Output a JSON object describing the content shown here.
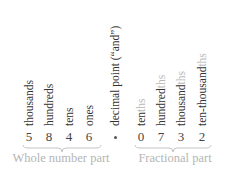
{
  "number": "5846.0732",
  "colors": {
    "text": "#333333",
    "muted": "#b5b5b5"
  },
  "whole_part": {
    "caption": "Whole number part",
    "places": [
      {
        "label": "thousands",
        "suffix": "",
        "digit": "5"
      },
      {
        "label": "hundreds",
        "suffix": "",
        "digit": "8"
      },
      {
        "label": "tens",
        "suffix": "",
        "digit": "4"
      },
      {
        "label": "ones",
        "suffix": "",
        "digit": "6"
      }
    ]
  },
  "decimal_point": {
    "label": "decimal point (“and”)",
    "symbol": "•"
  },
  "fractional_part": {
    "caption": "Fractional part",
    "places": [
      {
        "label": "ten",
        "suffix": "ths",
        "digit": "0"
      },
      {
        "label": "hundred",
        "suffix": "ths",
        "digit": "7"
      },
      {
        "label": "thousand",
        "suffix": "ths",
        "digit": "3"
      },
      {
        "label": "ten-thousand",
        "suffix": "ths",
        "digit": "2"
      }
    ]
  }
}
